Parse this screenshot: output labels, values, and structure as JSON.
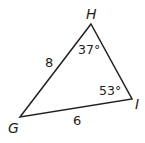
{
  "figure": {
    "type": "triangle",
    "stroke_color": "#231f20",
    "vertices": {
      "H": {
        "label": "H"
      },
      "G": {
        "label": "G"
      },
      "I": {
        "label": "I"
      }
    },
    "sides": {
      "GH": {
        "label": "8"
      },
      "GI": {
        "label": "6"
      }
    },
    "angles": {
      "H": {
        "label": "37°"
      },
      "I": {
        "label": "53°"
      }
    }
  }
}
